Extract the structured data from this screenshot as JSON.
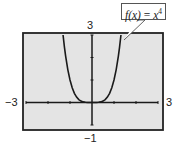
{
  "chart_data": {
    "type": "line",
    "title": "",
    "function_label": "f(x) = x^4",
    "function_label_parts": {
      "lhs": "f(x)",
      "eq": "=",
      "base": "x",
      "exp": "4"
    },
    "xlabel": "",
    "ylabel": "",
    "xlim": [
      -3,
      3
    ],
    "ylim": [
      -1,
      3
    ],
    "x_tick_labels": {
      "min": "-3",
      "max": "3"
    },
    "y_tick_labels": {
      "min": "-1",
      "max": "3"
    },
    "x_ticks": [
      -3,
      -2,
      -1,
      0,
      1,
      2,
      3
    ],
    "y_ticks": [
      -1,
      0,
      1,
      2,
      3
    ],
    "grid": false,
    "background": "#e4e4e4",
    "series": [
      {
        "name": "f(x) = x^4",
        "x": [
          -1.316,
          -1.25,
          -1.2,
          -1.1,
          -1.0,
          -0.9,
          -0.8,
          -0.7,
          -0.6,
          -0.5,
          -0.4,
          -0.3,
          -0.2,
          -0.1,
          0.0,
          0.1,
          0.2,
          0.3,
          0.4,
          0.5,
          0.6,
          0.7,
          0.8,
          0.9,
          1.0,
          1.1,
          1.2,
          1.25,
          1.316
        ],
        "y": [
          3.0,
          2.441,
          2.074,
          1.464,
          1.0,
          0.656,
          0.41,
          0.24,
          0.13,
          0.063,
          0.026,
          0.008,
          0.002,
          0.0,
          0.0,
          0.0,
          0.002,
          0.008,
          0.026,
          0.063,
          0.13,
          0.24,
          0.41,
          0.656,
          1.0,
          1.464,
          2.074,
          2.441,
          3.0
        ]
      }
    ]
  }
}
